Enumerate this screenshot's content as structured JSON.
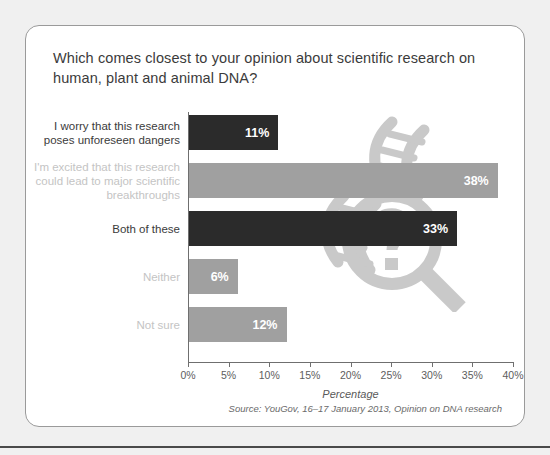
{
  "card": {
    "title": "Which comes closest to your opinion about scientific research on human, plant and animal DNA?",
    "source": "Source: YouGov, 16–17 January 2013, Opinion on DNA research"
  },
  "watermark": {
    "name": "dna-magnifier-watermark",
    "color": "#c9c9c9"
  },
  "colors": {
    "bar_dark": "#2b2b2b",
    "bar_light": "#a0a0a0",
    "label_dark": "#3b3b3b",
    "label_light": "#c4c4c4",
    "axis": "#6f6f6f",
    "value_text": "#ffffff",
    "card_background": "#ffffff",
    "page_background": "#f0f0f0"
  },
  "chart_data": {
    "type": "bar",
    "orientation": "horizontal",
    "title": "Which comes closest to your opinion about scientific research on human, plant and animal DNA?",
    "categories": [
      "I worry that this research\nposes unforeseen dangers",
      "I'm excited that this research\ncould lead to major scientific\nbreakthroughs",
      "Both of these",
      "Neither",
      "Not sure"
    ],
    "values": [
      11,
      38,
      33,
      6,
      12
    ],
    "value_labels": [
      "11%",
      "38%",
      "33%",
      "6%",
      "12%"
    ],
    "bar_colors": [
      "#2b2b2b",
      "#a0a0a0",
      "#2b2b2b",
      "#a0a0a0",
      "#a0a0a0"
    ],
    "label_colors": [
      "#3b3b3b",
      "#c4c4c4",
      "#3b3b3b",
      "#c4c4c4",
      "#c4c4c4"
    ],
    "xlabel": "Percentage",
    "ylabel": "",
    "xlim": [
      0,
      40
    ],
    "xticks": [
      0,
      5,
      10,
      15,
      20,
      25,
      30,
      35,
      40
    ],
    "xtick_labels": [
      "0%",
      "5%",
      "10%",
      "15%",
      "20%",
      "25%",
      "30%",
      "35%",
      "40%"
    ],
    "grid": false,
    "legend": "none"
  }
}
